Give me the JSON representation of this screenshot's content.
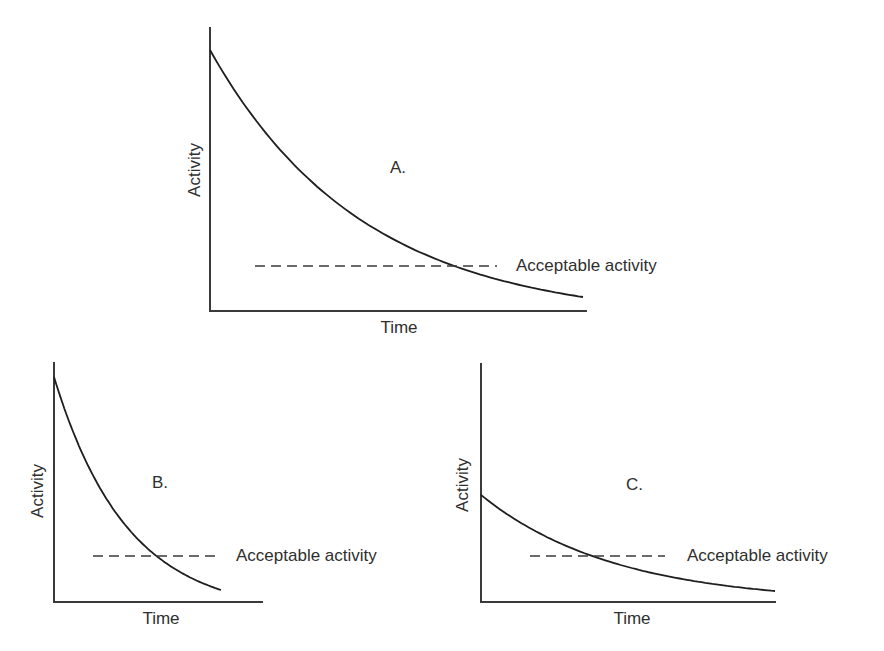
{
  "chart_data": [
    {
      "id": "A",
      "type": "line",
      "title": "A.",
      "xlabel": "Time",
      "ylabel": "Activity",
      "reference_line": {
        "label": "Acceptable activity",
        "style": "dashed",
        "value": 0.16
      },
      "series": [
        {
          "name": "Activity decay (slow)",
          "initial_value": 0.91,
          "final_value": 0.05,
          "shape": "exponential-decay"
        }
      ],
      "xlim": [
        0,
        1
      ],
      "ylim": [
        0,
        1
      ],
      "grid": false,
      "ticks": false,
      "geometry": {
        "axis_x0": 210,
        "axis_y_top": 27,
        "axis_y0": 311,
        "axis_x_end": 587,
        "curve_start": [
          210,
          50
        ],
        "curve_end": [
          583,
          297
        ],
        "curve_k": 2.45,
        "dash_y": 266,
        "dash_x1": 255,
        "dash_x2": 497,
        "label_x": 516,
        "label_y": 271,
        "title_x": 390,
        "title_y": 173,
        "xlabel_x": 399,
        "xlabel_y": 333,
        "ylabel_x": 200,
        "ylabel_y": 170
      }
    },
    {
      "id": "B",
      "type": "line",
      "title": "B.",
      "xlabel": "Time",
      "ylabel": "Activity",
      "reference_line": {
        "label": "Acceptable activity",
        "style": "dashed",
        "value": 0.19
      },
      "series": [
        {
          "name": "Activity decay (fast)",
          "initial_value": 0.94,
          "final_value": 0.05,
          "shape": "exponential-decay"
        }
      ],
      "xlim": [
        0,
        1
      ],
      "ylim": [
        0,
        1
      ],
      "grid": false,
      "ticks": false,
      "geometry": {
        "axis_x0": 54,
        "axis_y_top": 362,
        "axis_y0": 602,
        "axis_x_end": 263,
        "curve_start": [
          54,
          377
        ],
        "curve_end": [
          221,
          590
        ],
        "curve_k": 2.3,
        "dash_y": 556,
        "dash_x1": 93,
        "dash_x2": 217,
        "label_x": 236,
        "label_y": 561,
        "title_x": 152,
        "title_y": 488,
        "xlabel_x": 161,
        "xlabel_y": 624,
        "ylabel_x": 43,
        "ylabel_y": 491
      }
    },
    {
      "id": "C",
      "type": "line",
      "title": "C.",
      "xlabel": "Time",
      "ylabel": "Activity",
      "reference_line": {
        "label": "Acceptable activity",
        "style": "dashed",
        "value": 0.19
      },
      "series": [
        {
          "name": "Activity decay (low start)",
          "initial_value": 0.45,
          "final_value": 0.05,
          "shape": "exponential-decay"
        }
      ],
      "xlim": [
        0,
        1
      ],
      "ylim": [
        0,
        1
      ],
      "grid": false,
      "ticks": false,
      "geometry": {
        "axis_x0": 481,
        "axis_y_top": 363,
        "axis_y0": 602,
        "axis_x_end": 776,
        "curve_start": [
          481,
          495
        ],
        "curve_end": [
          775,
          591
        ],
        "curve_k": 2.2,
        "dash_y": 556,
        "dash_x1": 530,
        "dash_x2": 665,
        "label_x": 687,
        "label_y": 561,
        "title_x": 626,
        "title_y": 490,
        "xlabel_x": 632,
        "xlabel_y": 624,
        "ylabel_x": 468,
        "ylabel_y": 485
      }
    }
  ],
  "style": {
    "axis_color": "#3a3a3a",
    "curve_color": "#1e1e1e",
    "dash_color": "#3a3a3a",
    "text_color": "#2f2f2f",
    "background": "#ffffff"
  }
}
